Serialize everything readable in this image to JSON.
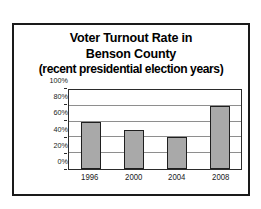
{
  "chart_data": {
    "type": "bar",
    "title": "Voter Turnout Rate in Benson County (recent presidential election years)",
    "title_lines": [
      "Voter Turnout Rate in",
      "Benson County",
      "(recent presidential election years)"
    ],
    "categories": [
      "1996",
      "2000",
      "2004",
      "2008"
    ],
    "values": [
      60,
      50,
      40,
      80
    ],
    "value_labels": [
      "60%",
      "50%",
      "40%",
      "80%"
    ],
    "xlabel": "",
    "ylabel": "",
    "ylim": [
      0,
      100
    ],
    "ytick_values": [
      0,
      20,
      40,
      60,
      80,
      100
    ],
    "ytick_labels": [
      "0%",
      "20%",
      "40%",
      "60%",
      "80%",
      "100%"
    ],
    "grid": "horizontal",
    "legend": "none",
    "series": [
      {
        "name": "Voter Turnout Rate",
        "values": [
          60,
          50,
          40,
          80
        ]
      }
    ],
    "colors": {
      "bar_fill": "#a9a9a9",
      "bar_border": "#1f1f1f",
      "gridline": "#8e8e8e",
      "axis": "#2b2b2b",
      "frame": "#1a1a1a",
      "text": "#000000",
      "background": "#ffffff"
    }
  }
}
